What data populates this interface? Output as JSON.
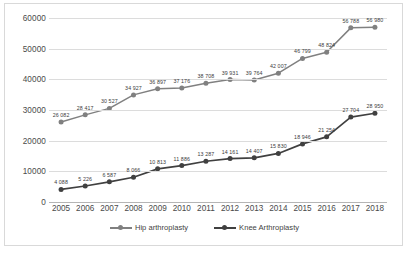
{
  "chart_data": {
    "type": "line",
    "title": "",
    "xlabel": "",
    "ylabel": "",
    "ylim": [
      0,
      60000
    ],
    "yticks": [
      0,
      10000,
      20000,
      30000,
      40000,
      50000,
      60000
    ],
    "ytick_labels": [
      "0",
      "10000",
      "20000",
      "30000",
      "40000",
      "50000",
      "60000"
    ],
    "grid": true,
    "legend_position": "bottom",
    "categories": [
      "2005",
      "2006",
      "2007",
      "2008",
      "2009",
      "2010",
      "2011",
      "2012",
      "2013",
      "2014",
      "2015",
      "2016",
      "2017",
      "2018"
    ],
    "series": [
      {
        "name": "Hip arthroplasty",
        "color": "#808080",
        "values": [
          26082,
          28417,
          30527,
          34927,
          36897,
          37176,
          38708,
          39931,
          39764,
          42007,
          46799,
          48824,
          56788,
          56980
        ],
        "labels": [
          "26 082",
          "28 417",
          "30 527",
          "34 927",
          "36 897",
          "37 176",
          "38 708",
          "39 931",
          "39 764",
          "42 007",
          "46 799",
          "48 824",
          "56 788",
          "56 980"
        ]
      },
      {
        "name": "Knee Arthroplasty",
        "color": "#404040",
        "values": [
          4088,
          5226,
          6587,
          8066,
          10813,
          11886,
          13287,
          14161,
          14407,
          15830,
          18946,
          21254,
          27704,
          28950
        ],
        "labels": [
          "4 088",
          "5 226",
          "6 587",
          "8 066",
          "10 813",
          "11 886",
          "13 287",
          "14 161",
          "14 407",
          "15 830",
          "18 946",
          "21 254",
          "27 704",
          "28 950"
        ]
      }
    ]
  },
  "legend": {
    "items": [
      {
        "label": "Hip arthroplasty"
      },
      {
        "label": "Knee Arthroplasty"
      }
    ]
  }
}
